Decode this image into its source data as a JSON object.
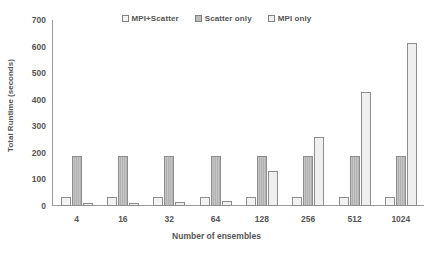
{
  "chart_data": {
    "type": "bar",
    "title": "",
    "xlabel": "Number of ensembles",
    "ylabel": "Total Runtime (seconds)",
    "categories": [
      "4",
      "16",
      "32",
      "64",
      "128",
      "256",
      "512",
      "1024"
    ],
    "series": [
      {
        "name": "MPI+Scatter",
        "values": [
          35,
          35,
          35,
          35,
          35,
          35,
          35,
          35
        ]
      },
      {
        "name": "Scatter only",
        "values": [
          190,
          190,
          190,
          190,
          190,
          190,
          190,
          190
        ]
      },
      {
        "name": "MPI only",
        "values": [
          13,
          13,
          15,
          17,
          130,
          260,
          430,
          612
        ]
      }
    ],
    "ylim": [
      0,
      700
    ],
    "yticks": [
      700,
      600,
      500,
      400,
      300,
      200,
      100,
      0
    ],
    "grid": false,
    "legend_position": "top-center"
  },
  "legend": {
    "entries": [
      {
        "label": "MPI+Scatter",
        "swatch_color": "#f2f2f2"
      },
      {
        "label": "Scatter only",
        "swatch_color": "#bdbdbd"
      },
      {
        "label": "MPI only",
        "swatch_color": "#efefef"
      }
    ]
  },
  "colors": {
    "axis": "#9a9a9a",
    "text": "#555555",
    "series_0": "#f2f2f2",
    "series_1": "#bdbdbd",
    "series_2": "#efefef"
  }
}
